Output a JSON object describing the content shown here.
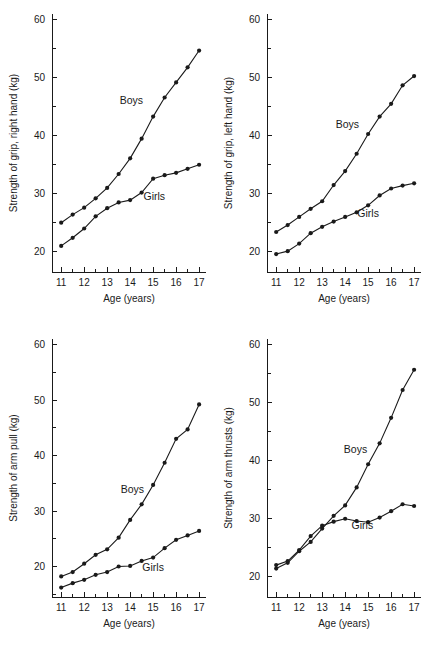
{
  "figure": {
    "panel_count": 4,
    "shared_xlabel": "Age (years)",
    "shared_x_ticks": [
      "11",
      "12",
      "13",
      "14",
      "15",
      "16",
      "17"
    ],
    "shared_y_ticks": [
      "20",
      "30",
      "40",
      "50",
      "60"
    ],
    "series_names": [
      "Boys",
      "Girls"
    ],
    "line_color": "#1a1a1a",
    "marker_color": "#1a1a1a",
    "background_color": "#ffffff"
  },
  "chart_data": [
    {
      "type": "line",
      "panel": "top-left",
      "title": "",
      "xlabel": "Age (years)",
      "ylabel": "Strength of grip, right hand (kg)",
      "xlim": [
        10.6,
        17.3
      ],
      "ylim": [
        16.5,
        61.0
      ],
      "x_ticks": [
        11,
        12,
        13,
        14,
        15,
        16,
        17
      ],
      "x_minor_step": 0.5,
      "y_ticks": [
        20,
        30,
        40,
        50,
        60
      ],
      "y_minor_step": 5,
      "grid": false,
      "legend_position": "inline-annotation",
      "x": [
        11,
        11.5,
        12,
        12.5,
        13,
        13.5,
        14,
        14.5,
        15,
        15.5,
        16,
        16.5,
        17
      ],
      "series": [
        {
          "name": "Boys",
          "label_x": 14.05,
          "label_y": 45.4,
          "values": [
            25.0,
            26.4,
            27.6,
            29.2,
            31.0,
            33.4,
            36.1,
            39.5,
            43.3,
            46.6,
            49.2,
            51.8,
            54.7
          ]
        },
        {
          "name": "Girls",
          "label_x": 15.05,
          "label_y": 29.0,
          "values": [
            21.0,
            22.4,
            24.0,
            26.1,
            27.5,
            28.5,
            28.9,
            30.2,
            32.6,
            33.2,
            33.6,
            34.3,
            35.0
          ]
        }
      ]
    },
    {
      "type": "line",
      "panel": "top-right",
      "title": "",
      "xlabel": "Age (years)",
      "ylabel": "Strength of grip, left hand (kg)",
      "xlim": [
        10.6,
        17.3
      ],
      "ylim": [
        16.5,
        61.0
      ],
      "x_ticks": [
        11,
        12,
        13,
        14,
        15,
        16,
        17
      ],
      "x_minor_step": 0.5,
      "y_ticks": [
        20,
        30,
        40,
        50,
        60
      ],
      "y_minor_step": 5,
      "grid": false,
      "legend_position": "inline-annotation",
      "x": [
        11,
        11.5,
        12,
        12.5,
        13,
        13.5,
        14,
        14.5,
        15,
        15.5,
        16,
        16.5,
        17
      ],
      "series": [
        {
          "name": "Boys",
          "label_x": 14.1,
          "label_y": 41.3,
          "values": [
            23.4,
            24.6,
            26.0,
            27.4,
            28.7,
            31.5,
            33.9,
            36.9,
            40.3,
            43.3,
            45.5,
            48.7,
            50.3
          ]
        },
        {
          "name": "Girls",
          "label_x": 15.0,
          "label_y": 26.0,
          "values": [
            19.6,
            20.1,
            21.4,
            23.2,
            24.3,
            25.2,
            26.0,
            26.8,
            28.0,
            29.7,
            30.9,
            31.4,
            31.8
          ]
        }
      ]
    },
    {
      "type": "line",
      "panel": "bottom-left",
      "title": "",
      "xlabel": "Age (years)",
      "ylabel": "Strength of arm pull (kg)",
      "xlim": [
        10.6,
        17.3
      ],
      "ylim": [
        14.5,
        61.0
      ],
      "x_ticks": [
        11,
        12,
        13,
        14,
        15,
        16,
        17
      ],
      "x_minor_step": 0.5,
      "y_ticks": [
        20,
        30,
        40,
        50,
        60
      ],
      "y_minor_step": 5,
      "grid": false,
      "legend_position": "inline-annotation",
      "x": [
        11,
        11.5,
        12,
        12.5,
        13,
        13.5,
        14,
        14.5,
        15,
        15.5,
        16,
        16.5,
        17
      ],
      "series": [
        {
          "name": "Boys",
          "label_x": 14.1,
          "label_y": 33.2,
          "values": [
            18.2,
            19.0,
            20.5,
            22.1,
            23.1,
            25.2,
            28.4,
            31.2,
            34.7,
            38.7,
            43.0,
            44.7,
            49.2
          ]
        },
        {
          "name": "Girls",
          "label_x": 15.0,
          "label_y": 19.2,
          "values": [
            16.2,
            17.0,
            17.6,
            18.5,
            19.0,
            20.0,
            20.1,
            21.0,
            21.6,
            23.3,
            24.8,
            25.6,
            26.4
          ]
        }
      ]
    },
    {
      "type": "line",
      "panel": "bottom-right",
      "title": "",
      "xlabel": "Age (years)",
      "ylabel": "Strength of arm thrusts (kg)",
      "xlim": [
        10.6,
        17.3
      ],
      "ylim": [
        16.5,
        61.0
      ],
      "x_ticks": [
        11,
        12,
        13,
        14,
        15,
        16,
        17
      ],
      "x_minor_step": 0.5,
      "y_ticks": [
        20,
        30,
        40,
        50,
        60
      ],
      "y_minor_step": 5,
      "grid": false,
      "legend_position": "inline-annotation",
      "x": [
        11,
        11.5,
        12,
        12.5,
        13,
        13.5,
        14,
        14.5,
        15,
        15.5,
        16,
        16.5,
        17
      ],
      "series": [
        {
          "name": "Boys",
          "label_x": 14.45,
          "label_y": 41.3,
          "values": [
            21.4,
            22.4,
            24.4,
            26.0,
            28.3,
            30.5,
            32.3,
            35.4,
            39.4,
            43.0,
            47.4,
            52.2,
            55.7
          ]
        },
        {
          "name": "Girls",
          "label_x": 14.75,
          "label_y": 28.3,
          "values": [
            22.0,
            22.7,
            24.6,
            27.0,
            28.8,
            29.5,
            30.0,
            29.6,
            29.4,
            30.2,
            31.3,
            32.5,
            32.2
          ]
        }
      ]
    }
  ]
}
